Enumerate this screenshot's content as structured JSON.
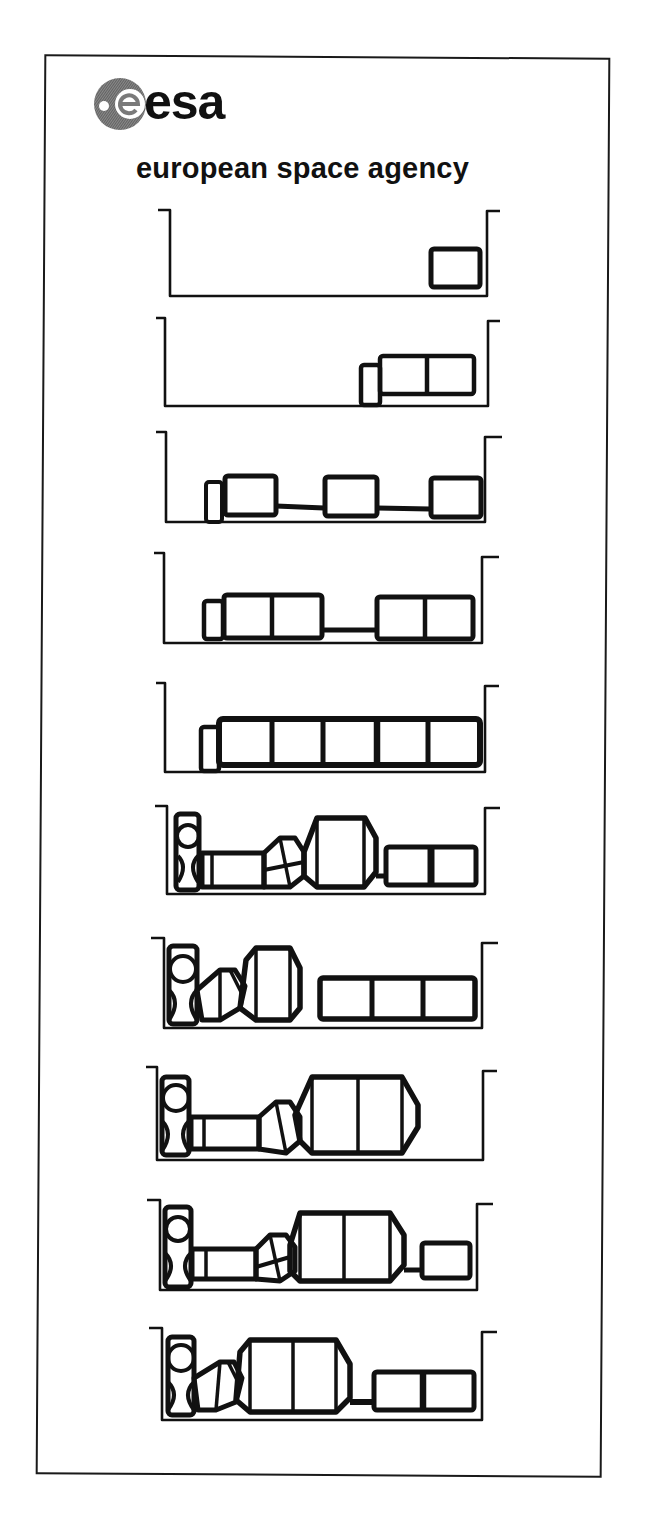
{
  "header": {
    "logo_wordmark": "esa",
    "logo_icon": "esa-globe-logo-icon",
    "agency_name": "european space agency"
  },
  "colors": {
    "ink": "#111111",
    "paper": "#ffffff",
    "logo_gray": "#6e6e6e"
  },
  "diagram": {
    "stage_count": 10,
    "stages": [
      {
        "index": 1,
        "top": 200,
        "description": "Single module at right end of bay"
      },
      {
        "index": 2,
        "top": 310,
        "description": "Two-segment module with small end element"
      },
      {
        "index": 3,
        "top": 426,
        "description": "Three modules linked by connectors"
      },
      {
        "index": 4,
        "top": 545,
        "description": "Two double modules linked by connector"
      },
      {
        "index": 5,
        "top": 670,
        "description": "Five-segment module train"
      },
      {
        "index": 6,
        "top": 795,
        "description": "Node, tunnel, adapter, large module, two-segment module"
      },
      {
        "index": 7,
        "top": 928,
        "description": "Node, adapter, large module, three-segment module"
      },
      {
        "index": 8,
        "top": 1055,
        "description": "Node, tunnel, adapter, large double module"
      },
      {
        "index": 9,
        "top": 1185,
        "description": "Node, tunnel, adapter, large double module, small module"
      },
      {
        "index": 10,
        "top": 1312,
        "description": "Node, adapter, large double module, two-segment module"
      }
    ]
  }
}
